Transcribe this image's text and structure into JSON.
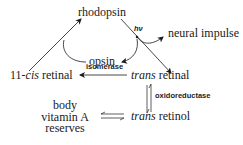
{
  "diagram": {
    "nodes": {
      "rhodopsin": "rhodopsin",
      "opsin": "opsin",
      "neural_impulse": "neural impulse",
      "cis_retinal_prefix": "11-",
      "cis_retinal_italic": "cis",
      "cis_retinal_suffix": " retinal",
      "trans_retinal_italic": "trans",
      "trans_retinal_suffix": " retinal",
      "trans_retinol_italic": "trans",
      "trans_retinol_suffix": " retinol",
      "reserves_line1": "body",
      "reserves_line2": "vitamin A",
      "reserves_line3": "reserves"
    },
    "edge_labels": {
      "light": "hν",
      "isomerase": "isomerase",
      "oxidoreductase": "oxidoreductase"
    },
    "edges": [
      {
        "from": "11-cis retinal",
        "to": "rhodopsin",
        "type": "arrow"
      },
      {
        "from": "rhodopsin",
        "to": "trans retinal",
        "type": "arrow",
        "label": "hν"
      },
      {
        "from": "rhodopsin",
        "to": "neural impulse",
        "type": "curved-arrow"
      },
      {
        "from": "rhodopsin",
        "to": "opsin",
        "type": "curved-arrow"
      },
      {
        "from": "opsin",
        "to": "rhodopsin",
        "type": "curved-line"
      },
      {
        "from": "trans retinal",
        "to": "11-cis retinal",
        "type": "arrow",
        "label": "isomerase"
      },
      {
        "from": "trans retinal",
        "to": "trans retinol",
        "type": "reversible",
        "label": "oxidoreductase"
      },
      {
        "from": "body vitamin A reserves",
        "to": "trans retinol",
        "type": "reversible"
      }
    ],
    "colors": {
      "ink": "#1a1a1a",
      "background": "#ffffff"
    }
  }
}
